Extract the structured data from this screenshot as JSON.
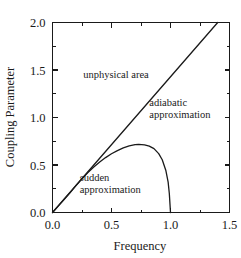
{
  "chart_data": {
    "type": "line",
    "title": "",
    "xlabel": "Frequency",
    "ylabel": "Coupling Parameter",
    "xlim": [
      0.0,
      1.5
    ],
    "ylim": [
      0.0,
      2.0
    ],
    "grid": false,
    "legend": "none",
    "xticks": [
      "0.0",
      "0.5",
      "1.0",
      "1.5"
    ],
    "xtick_values": [
      0.0,
      0.5,
      1.0,
      1.5
    ],
    "xminor_values": [
      0.25,
      0.75,
      1.25
    ],
    "yticks": [
      "0.0",
      "0.5",
      "1.0",
      "1.5",
      "2.0"
    ],
    "ytick_values": [
      0.0,
      0.5,
      1.0,
      1.5,
      2.0
    ],
    "series": [
      {
        "name": "boundary-line",
        "kind": "line",
        "x": [
          0.0,
          1.4
        ],
        "y": [
          0.0,
          2.0
        ]
      },
      {
        "name": "sudden-adiabatic-boundary-curve",
        "kind": "curve",
        "x": [
          0.0,
          0.05,
          0.1,
          0.15,
          0.2,
          0.25,
          0.3,
          0.35,
          0.4,
          0.45,
          0.5,
          0.55,
          0.6,
          0.65,
          0.7,
          0.73,
          0.78,
          0.82,
          0.86,
          0.9,
          0.93,
          0.96,
          0.98,
          0.99,
          1.0
        ],
        "y": [
          0.0,
          0.07,
          0.14,
          0.21,
          0.285,
          0.355,
          0.42,
          0.478,
          0.532,
          0.578,
          0.618,
          0.652,
          0.68,
          0.701,
          0.714,
          0.717,
          0.712,
          0.698,
          0.672,
          0.62,
          0.555,
          0.445,
          0.32,
          0.2,
          0.0
        ]
      }
    ],
    "annotations": [
      {
        "name": "unphysical-area",
        "lines": [
          "unphysical area"
        ],
        "x": 0.26,
        "y": 1.42
      },
      {
        "name": "adiabatic-approximation",
        "lines": [
          "adiabatic",
          "approximation"
        ],
        "x": 0.82,
        "y": 1.12
      },
      {
        "name": "sudden-approximation",
        "lines": [
          "sudden",
          "approximation"
        ],
        "x": 0.23,
        "y": 0.33
      }
    ]
  },
  "axes": {
    "x_title": "Frequency",
    "y_title": "Coupling Parameter"
  },
  "colors": {
    "line": "#1a1a1a",
    "background": "#ffffff",
    "text": "#1a1a1a"
  }
}
